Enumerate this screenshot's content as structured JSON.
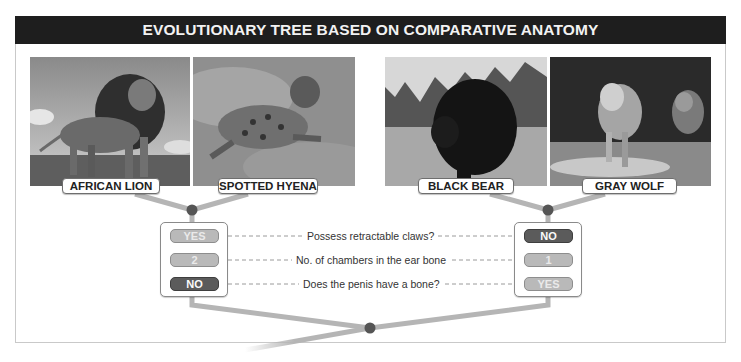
{
  "title": "EVOLUTIONARY TREE BASED ON COMPARATIVE ANATOMY",
  "animals": [
    {
      "name": "AFRICAN LION",
      "photo": "lion-photo"
    },
    {
      "name": "SPOTTED HYENA",
      "photo": "hyena-photo"
    },
    {
      "name": "BLACK BEAR",
      "photo": "bear-photo"
    },
    {
      "name": "GRAY WOLF",
      "photo": "wolf-photo"
    }
  ],
  "traits": [
    {
      "question": "Possess retractable claws?",
      "left": "YES",
      "right": "NO"
    },
    {
      "question": "No. of chambers in the ear bone",
      "left": "2",
      "right": "1"
    },
    {
      "question": "Does the penis have a bone?",
      "left": "NO",
      "right": "YES"
    }
  ],
  "colors": {
    "title_bg": "#1e1e1e",
    "branch": "#b5b5b5",
    "node": "#555555",
    "pill_dark": "#5b5b5b",
    "pill_light": "#b9b9b9"
  }
}
